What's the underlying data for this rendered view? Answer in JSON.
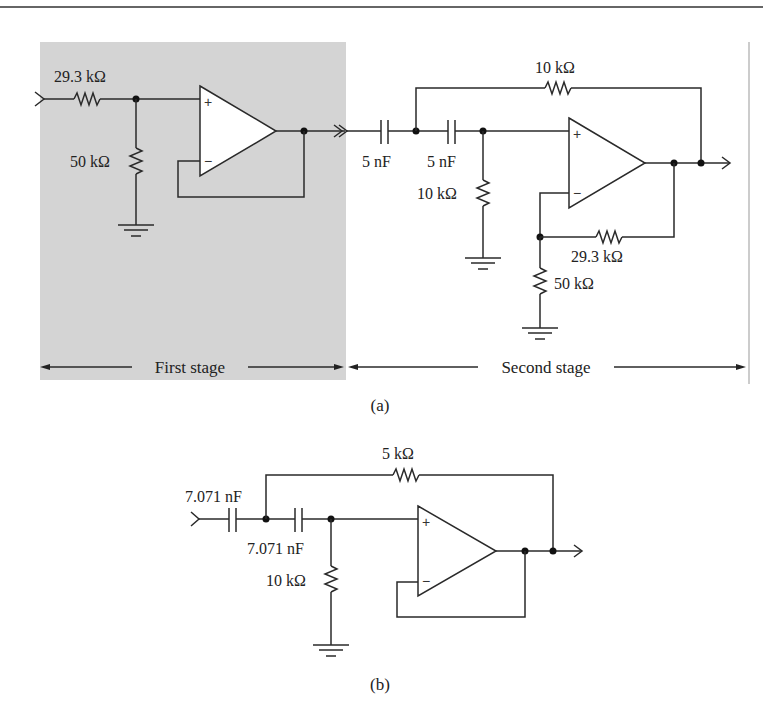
{
  "figure_a": {
    "caption": "(a)",
    "first_stage": {
      "label": "First stage",
      "shade_color": "#d4d4d4",
      "input_resistor": "29.3 kΩ",
      "shunt_resistor": "50 kΩ"
    },
    "second_stage": {
      "label": "Second stage",
      "capacitor_1": "5 nF",
      "capacitor_2": "5 nF",
      "feedback_resistor": "10 kΩ",
      "shunt_resistor": "10 kΩ",
      "gain_feedback_resistor": "29.3 kΩ",
      "gain_ground_resistor": "50 kΩ"
    }
  },
  "figure_b": {
    "caption": "(b)",
    "capacitor_1": "7.071 nF",
    "capacitor_2": "7.071 nF",
    "feedback_resistor": "5 kΩ",
    "shunt_resistor": "10 kΩ"
  },
  "opamp_symbols": {
    "plus": "+",
    "minus": "−"
  }
}
